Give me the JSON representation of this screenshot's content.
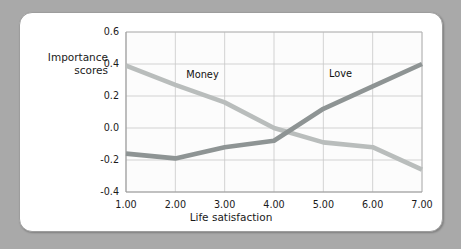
{
  "figure": {
    "background_color": "#a9a9a9",
    "card_color": "#ffffff",
    "card_border_color": "#9d9d9d"
  },
  "axis_titles": {
    "y_line1": "Importance",
    "y_line2": "scores",
    "x": "Life satisfaction"
  },
  "series_labels": {
    "money": "Money",
    "love": "Love"
  },
  "ticks": {
    "y": [
      "0.6",
      "0.4",
      "0.2",
      "0.0",
      "-0.2",
      "-0.4"
    ],
    "x": [
      "1.00",
      "2.00",
      "3.00",
      "4.00",
      "5.00",
      "6.00",
      "7.00"
    ]
  },
  "chart_data": {
    "type": "line",
    "title": "",
    "xlabel": "Life satisfaction",
    "ylabel": "Importance scores",
    "xlim": [
      1,
      7
    ],
    "ylim": [
      -0.4,
      0.6
    ],
    "ytick_values": [
      0.6,
      0.4,
      0.2,
      0.0,
      -0.2,
      -0.4
    ],
    "xtick_values": [
      1,
      2,
      3,
      4,
      5,
      6,
      7
    ],
    "xtick_labels": [
      "1.00",
      "2.00",
      "3.00",
      "4.00",
      "5.00",
      "6.00",
      "7.00"
    ],
    "ytick_labels": [
      "0.6",
      "0.4",
      "0.2",
      "0.0",
      "-0.2",
      "-0.4"
    ],
    "grid": true,
    "legend": "inline-labels",
    "x": [
      1,
      2,
      3,
      4,
      5,
      6,
      7
    ],
    "series": [
      {
        "name": "Money",
        "color": "#b9bdbc",
        "values": [
          0.39,
          0.27,
          0.16,
          0.0,
          -0.09,
          -0.12,
          -0.26
        ],
        "label_x": 2.55,
        "label_y": 0.31
      },
      {
        "name": "Love",
        "color": "#8e9494",
        "values": [
          -0.16,
          -0.19,
          -0.12,
          -0.08,
          0.12,
          0.26,
          0.4
        ],
        "label_x": 5.35,
        "label_y": 0.32
      }
    ],
    "annotations": [
      {
        "text": "Money",
        "x": 2.55,
        "y": 0.31
      },
      {
        "text": "Love",
        "x": 5.35,
        "y": 0.32
      }
    ]
  }
}
